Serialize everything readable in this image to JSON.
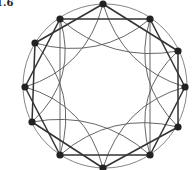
{
  "figure": {
    "label": "1.6",
    "center": [
      105,
      86
    ],
    "radius": 82,
    "node_count": 12,
    "nodes": [
      [
        103,
        4
      ],
      [
        150,
        19
      ],
      [
        178,
        51
      ],
      [
        185,
        87
      ],
      [
        178,
        127
      ],
      [
        150,
        155
      ],
      [
        103,
        168
      ],
      [
        60,
        155
      ],
      [
        32,
        122
      ],
      [
        25,
        87
      ],
      [
        35,
        43
      ],
      [
        60,
        19
      ]
    ],
    "straight_chord_skip": [
      2
    ],
    "vertical_chords": [
      [
        1,
        5
      ],
      [
        11,
        7
      ]
    ],
    "arc_skip": 3,
    "colors": {
      "node": "#222222",
      "straight_edge": "#333333",
      "arc_edge": "#555555",
      "outer_circle": "#777777"
    }
  }
}
